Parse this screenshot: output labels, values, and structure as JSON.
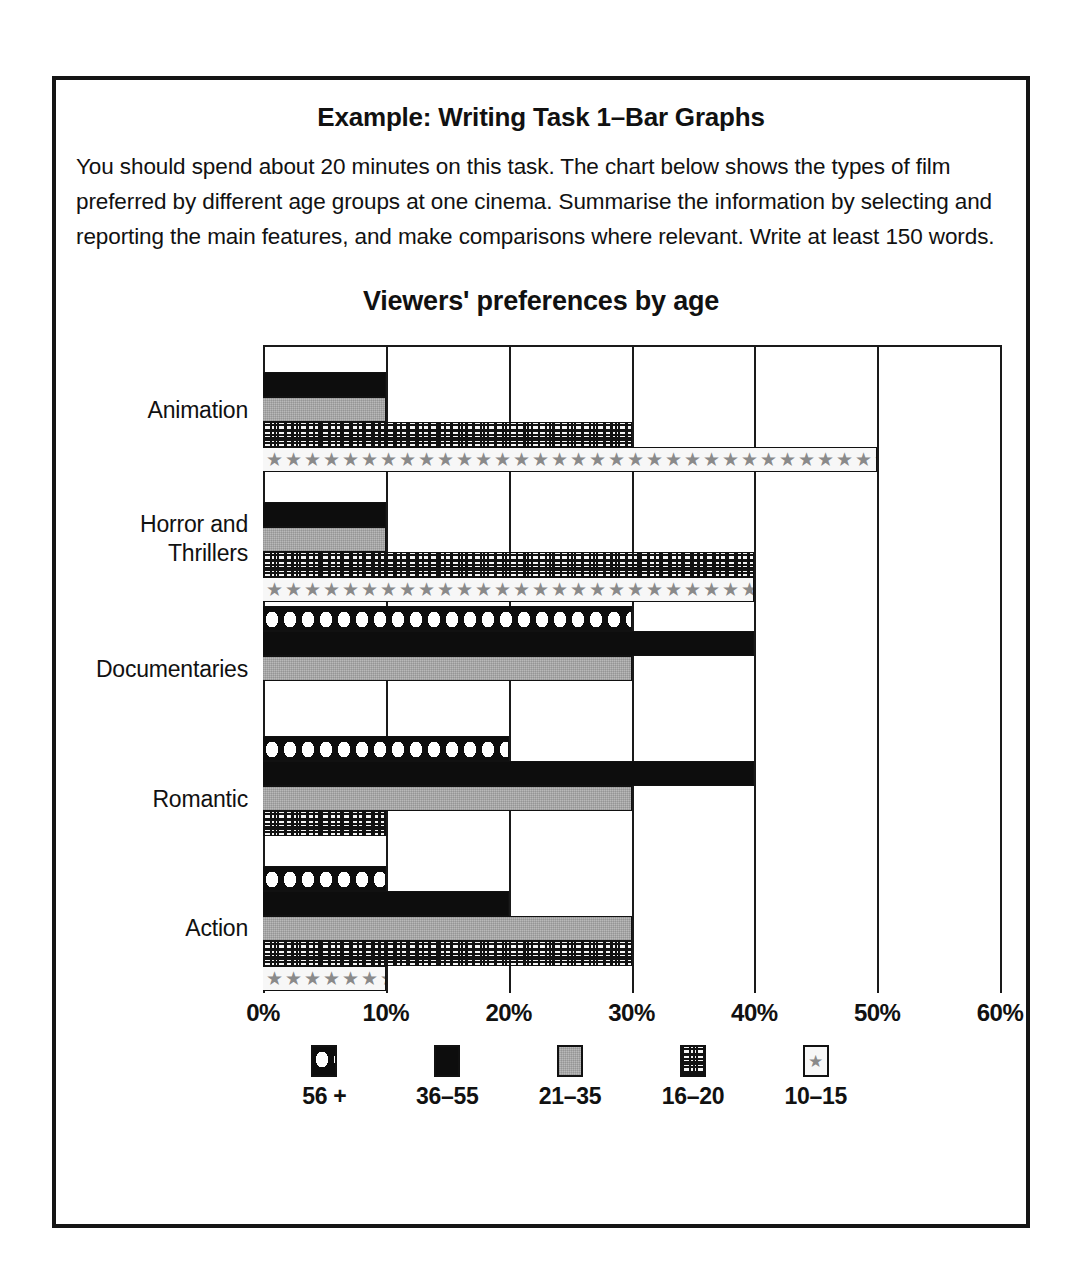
{
  "task": {
    "title": "Example: Writing Task 1–Bar Graphs",
    "body": "You should spend about 20 minutes on this task. The chart below shows the types of film preferred by different age groups at one cinema. Summarise the information by selecting and reporting the main features, and make comparisons where relevant. Write at least 150 words."
  },
  "chart_data": {
    "type": "bar",
    "orientation": "horizontal",
    "title": "Viewers' preferences by age",
    "xlabel": "",
    "ylabel": "",
    "xlim": [
      0,
      60
    ],
    "xunit": "%",
    "grid": true,
    "legend_position": "bottom",
    "categories": [
      "Animation",
      "Horror and\nThrillers",
      "Documentaries",
      "Romantic",
      "Action"
    ],
    "ticks": [
      "0%",
      "10%",
      "20%",
      "30%",
      "40%",
      "50%",
      "60%"
    ],
    "tick_values": [
      0,
      10,
      20,
      30,
      40,
      50,
      60
    ],
    "series": [
      {
        "name": "56 +",
        "pattern": "dots",
        "values": [
          0,
          0,
          30,
          20,
          10
        ]
      },
      {
        "name": "36–55",
        "pattern": "solid",
        "values": [
          10,
          10,
          40,
          40,
          20
        ]
      },
      {
        "name": "21–35",
        "pattern": "gray",
        "values": [
          10,
          10,
          30,
          30,
          30
        ]
      },
      {
        "name": "16–20",
        "pattern": "grid",
        "values": [
          30,
          40,
          0,
          10,
          30
        ]
      },
      {
        "name": "10–15",
        "pattern": "star",
        "values": [
          50,
          40,
          0,
          0,
          10
        ]
      }
    ]
  },
  "legend": {
    "items": [
      {
        "label": "56 +",
        "swatch": "polka-dot-swatch"
      },
      {
        "label": "36–55",
        "swatch": "solid-black-swatch"
      },
      {
        "label": "21–35",
        "swatch": "gray-swatch"
      },
      {
        "label": "16–20",
        "swatch": "crosshatch-swatch"
      },
      {
        "label": "10–15",
        "swatch": "star-swatch"
      }
    ]
  },
  "stars": "★★★★★★★★★★★★★★★★★★★★★★★★★★★★★★★★★★★★★★★★"
}
